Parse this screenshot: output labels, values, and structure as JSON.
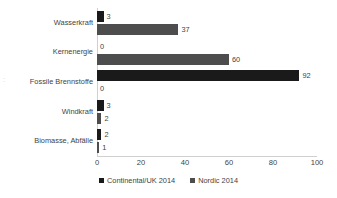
{
  "chart_data": {
    "type": "bar",
    "orientation": "horizontal",
    "title": "",
    "xlabel": "",
    "ylabel": "",
    "categories": [
      "Wasserkraft",
      "Kernenergie",
      "Fossile Brennstoffe",
      "Windkraft",
      "Biomasse, Abfälle"
    ],
    "series": [
      {
        "name": "Continental/UK 2014",
        "values": [
          3,
          0,
          92,
          3,
          2
        ],
        "color": "#1a1a1a"
      },
      {
        "name": "Nordic 2014",
        "values": [
          37,
          60,
          0,
          2,
          1
        ],
        "color": "#4d4d4d"
      }
    ],
    "xlim": [
      0,
      100
    ],
    "xticks": [
      0,
      20,
      40,
      60,
      80,
      100
    ],
    "xtick_labels": [
      "0",
      "20",
      "40",
      "60",
      "80",
      "100"
    ],
    "grid": false,
    "legend_position": "bottom",
    "data_labels": true,
    "axis_color": "#d0d0d0",
    "text_color": "#3f3f3f"
  },
  "artifact": {
    "edge_fragment": ":"
  }
}
